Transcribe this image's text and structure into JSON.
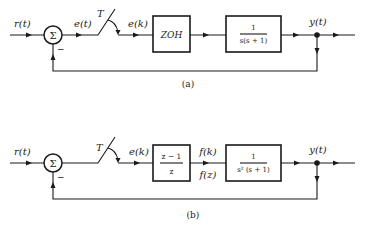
{
  "diagrams": [
    {
      "id": "a",
      "caption": "(a)",
      "input_label": "r(t)",
      "error_label": "e(t)",
      "sampler_label": "T",
      "sampled_label": "e(k)",
      "summing_symbol": "Σ",
      "feedback_sign": "−",
      "block1": {
        "text": "ZOH"
      },
      "block2": {
        "numerator": "1",
        "denominator": "s(s + 1)"
      },
      "output_label": "y(t)"
    },
    {
      "id": "b",
      "caption": "(b)",
      "input_label": "r(t)",
      "sampler_label": "T",
      "sampled_label": "e(k)",
      "summing_symbol": "Σ",
      "feedback_sign": "−",
      "block1": {
        "numerator": "z − 1",
        "denominator": "z"
      },
      "mid_label_top": "f(k)",
      "mid_label_bottom": "f(z)",
      "block2": {
        "numerator": "1",
        "denominator": "s² (s + 1)"
      },
      "output_label": "y(t)"
    }
  ]
}
